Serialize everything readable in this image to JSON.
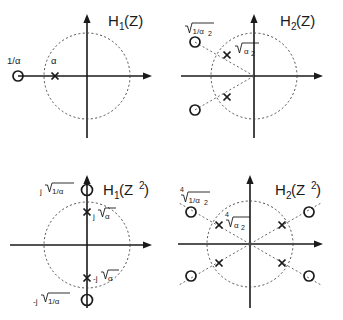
{
  "figure": {
    "kind": "pole-zero-plots",
    "panel_count": 4,
    "colors": {
      "ink": "#1a1a1a",
      "dashed": "#555555",
      "background": "#ffffff"
    },
    "marker_legend": {
      "pole": "x",
      "zero": "o"
    }
  },
  "panels": [
    {
      "id": "h1-z",
      "title_base": "H",
      "title_sub": "1",
      "title_arg": "(Z)",
      "title_arg_pow": "",
      "title_full": "H1(Z)",
      "unit_circle": true,
      "axes": {
        "real": true,
        "imaginary": true
      },
      "labels": [
        {
          "name": "zero-label-1-over-alpha",
          "text": "1/α"
        },
        {
          "name": "pole-label-alpha",
          "text": "α"
        }
      ],
      "poles": [
        {
          "label": "α",
          "angle_deg": 180,
          "radius_rel": 0.62
        }
      ],
      "zeros": [
        {
          "label": "1/α",
          "angle_deg": 180,
          "radius_rel": 1.62
        }
      ],
      "rays": []
    },
    {
      "id": "h2-z",
      "title_base": "H",
      "title_sub": "2",
      "title_arg": "(Z)",
      "title_arg_pow": "",
      "title_full": "H2(Z)",
      "unit_circle": true,
      "axes": {
        "real": true,
        "imaginary": true
      },
      "labels": [
        {
          "name": "zero-label-sqrt-1-over-alpha2",
          "radical": "2",
          "text": "1/α",
          "sub": "2"
        },
        {
          "name": "pole-label-sqrt-alpha2",
          "radical": "2",
          "text": "α",
          "sub": "2"
        }
      ],
      "poles": [
        {
          "angle_deg": 150,
          "radius_rel": 0.62
        },
        {
          "angle_deg": 210,
          "radius_rel": 0.62
        }
      ],
      "zeros": [
        {
          "angle_deg": 150,
          "radius_rel": 1.62
        },
        {
          "angle_deg": 210,
          "radius_rel": 1.62
        }
      ],
      "rays": [
        150,
        210
      ]
    },
    {
      "id": "h1-z2",
      "title_base": "H",
      "title_sub": "1",
      "title_arg": "(Z",
      "title_arg_pow": "2",
      "title_full": "H1(Z^2)",
      "unit_circle": true,
      "axes": {
        "real": true,
        "imaginary": true
      },
      "labels": [
        {
          "name": "zero-label-j-sqrt-1-over-alpha",
          "text": "j√(1/α)"
        },
        {
          "name": "pole-label-j-sqrt-alpha",
          "text": "j√α"
        },
        {
          "name": "pole-label-neg-j-sqrt-alpha",
          "text": "-j√α"
        },
        {
          "name": "zero-label-neg-j-sqrt-1-over-alpha",
          "text": "-j√(1/α)"
        }
      ],
      "poles": [
        {
          "angle_deg": 90,
          "radius_rel": 0.78
        },
        {
          "angle_deg": 270,
          "radius_rel": 0.78
        }
      ],
      "zeros": [
        {
          "angle_deg": 90,
          "radius_rel": 1.28
        },
        {
          "angle_deg": 270,
          "radius_rel": 1.28
        }
      ],
      "rays": []
    },
    {
      "id": "h2-z2",
      "title_base": "H",
      "title_sub": "2",
      "title_arg": "(Z",
      "title_arg_pow": "2",
      "title_full": "H2(Z^2)",
      "unit_circle": true,
      "axes": {
        "real": true,
        "imaginary": true
      },
      "labels": [
        {
          "name": "zero-label-4thrt-1-over-alpha2",
          "radical": "4",
          "text": "1/α",
          "sub": "2"
        },
        {
          "name": "pole-label-4thrt-alpha2",
          "radical": "4",
          "text": "α",
          "sub": "2"
        }
      ],
      "poles": [
        {
          "angle_deg": 30,
          "radius_rel": 0.68
        },
        {
          "angle_deg": 150,
          "radius_rel": 0.68
        },
        {
          "angle_deg": 210,
          "radius_rel": 0.68
        },
        {
          "angle_deg": 330,
          "radius_rel": 0.68
        }
      ],
      "zeros": [
        {
          "angle_deg": 30,
          "radius_rel": 1.52
        },
        {
          "angle_deg": 150,
          "radius_rel": 1.52
        },
        {
          "angle_deg": 210,
          "radius_rel": 1.52
        },
        {
          "angle_deg": 330,
          "radius_rel": 1.52
        }
      ],
      "rays": [
        30,
        150,
        210,
        330
      ]
    }
  ],
  "text": {
    "radical_glyph": "√",
    "alpha": "α",
    "j": "j",
    "minus_j": "-j",
    "one_over_alpha": "1/α",
    "alpha_sub2": "α",
    "sub2": "2",
    "root_index_4": "4",
    "h": "H",
    "open_z": "(Z",
    "close_paren": ")",
    "pow2": "2",
    "h1z": "H",
    "h1z_sub": "1",
    "h1z_arg": "(Z)",
    "h2z_sub": "2",
    "h2z_arg": "(Z)",
    "h1z2_sub": "1",
    "h1z2_arg_open": "(Z",
    "h1z2_arg_pow": "2",
    "h1z2_arg_close": ")",
    "h2z2_sub": "2",
    "h2z2_arg_open": "(Z",
    "h2z2_arg_pow": "2",
    "h2z2_arg_close": ")",
    "lbl_1_over_alpha": "1/α",
    "lbl_alpha": "α",
    "lbl_j_sqrt_1_over_alpha": "1/α",
    "lbl_j_prefix": "j",
    "lbl_neg_j_prefix": "-j",
    "lbl_sqrt_alpha": "α"
  }
}
